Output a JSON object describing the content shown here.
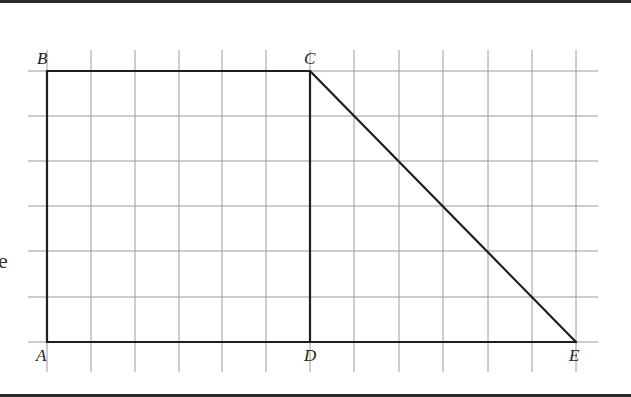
{
  "figure": {
    "grid": {
      "x_lines": [
        47,
        91,
        135,
        179,
        222,
        266,
        310,
        354,
        399,
        443,
        488,
        532,
        576
      ],
      "y_lines": [
        71,
        116,
        161,
        206,
        251,
        297,
        342
      ],
      "x_extent": [
        28,
        598
      ],
      "y_extent": [
        50,
        372
      ],
      "color": "#9a9a9a"
    },
    "shape_color": "#1e1e1e",
    "points": {
      "A": {
        "label": "A",
        "x": 47,
        "y": 342
      },
      "B": {
        "label": "B",
        "x": 47,
        "y": 71
      },
      "C": {
        "label": "C",
        "x": 310,
        "y": 71
      },
      "D": {
        "label": "D",
        "x": 310,
        "y": 342
      },
      "E": {
        "label": "E",
        "x": 576,
        "y": 342
      }
    },
    "segments": [
      [
        "A",
        "B"
      ],
      [
        "B",
        "C"
      ],
      [
        "C",
        "D"
      ],
      [
        "A",
        "E"
      ],
      [
        "C",
        "E"
      ]
    ],
    "side_text": "e"
  }
}
